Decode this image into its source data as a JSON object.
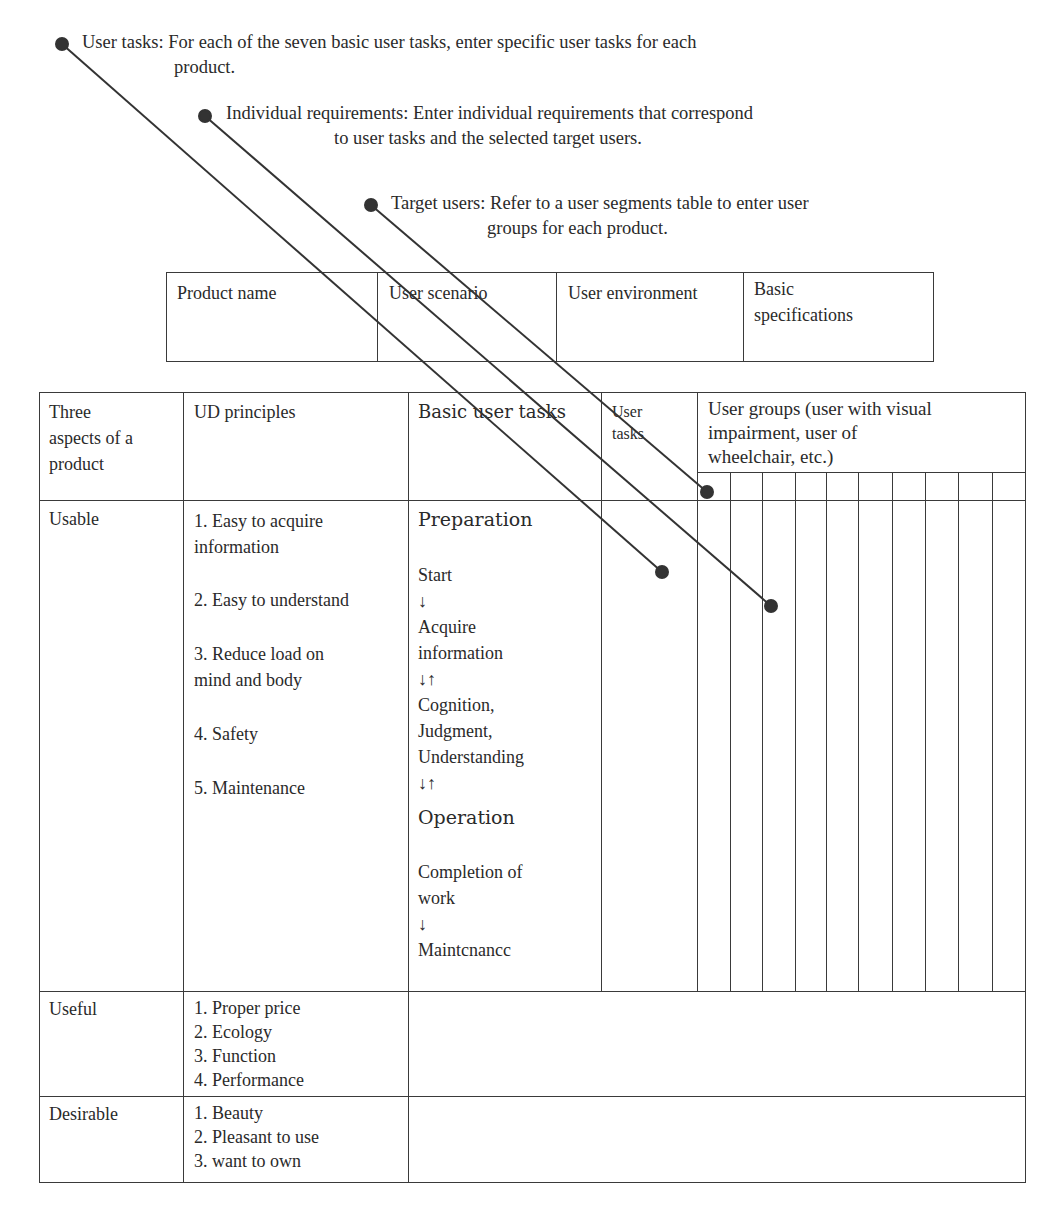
{
  "annotations": [
    {
      "id": "user-tasks",
      "line1": "User tasks: For each of the seven basic user tasks, enter specific user tasks for each",
      "line2": "product."
    },
    {
      "id": "individual-requirements",
      "line1": "Individual requirements: Enter individual requirements that correspond",
      "line2": "to user tasks and the selected target users."
    },
    {
      "id": "target-users",
      "line1": "Target users: Refer to a user segments table to enter user",
      "line2": "groups for each product."
    }
  ],
  "product_table": {
    "headers": [
      "Product name",
      "User scenario",
      "User environment",
      "Basic\nspecifications"
    ]
  },
  "main_table": {
    "headers": {
      "aspects": "Three\naspects of a\nproduct",
      "principles": "UD principles",
      "basic_tasks": "Basic user tasks",
      "user_tasks": "User\ntasks",
      "user_groups": "User groups (user with visual\nimpairment, user of\nwheelchair, etc.)"
    },
    "user_group_subcolumns": 10,
    "rows": [
      {
        "aspect": "Usable",
        "principles": [
          "1. Easy to acquire\ninformation",
          "2. Easy to understand",
          "3. Reduce load on\nmind and body",
          "4. Safety",
          "5. Maintenance"
        ],
        "basic_tasks": {
          "preparation": "Preparation",
          "flow1": "Start\n ↓\nAcquire\ninformation\n↓↑\nCognition,\nJudgment,\nUnderstanding\n↓↑",
          "operation": "Operation",
          "flow2": "Completion of\nwork\n↓\nMaintcnancc"
        }
      },
      {
        "aspect": "Useful",
        "principles": "1. Proper price\n2. Ecology\n3. Function\n4. Performance"
      },
      {
        "aspect": "Desirable",
        "principles": "1. Beauty\n2. Pleasant to use\n3. want to own"
      }
    ]
  },
  "colors": {
    "ink": "#2a2a2a",
    "line": "#3a3a3a",
    "dot": "#333333"
  }
}
